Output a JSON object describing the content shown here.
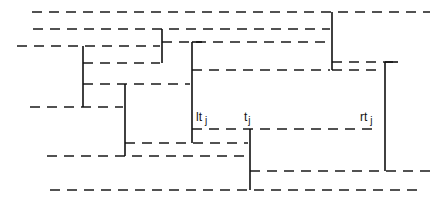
{
  "diagram": {
    "type": "timeline-interval-diagram",
    "labels": [
      {
        "id": "lt",
        "main": "lt",
        "sub": "j",
        "x": 196,
        "y": 121
      },
      {
        "id": "t",
        "main": "t",
        "sub": "j",
        "x": 244,
        "y": 121
      },
      {
        "id": "rt",
        "main": "rt",
        "sub": "j",
        "x": 360,
        "y": 121
      }
    ],
    "dashed_lines": [
      {
        "x1": 32,
        "y1": 12,
        "x2": 430,
        "y2": 12
      },
      {
        "x1": 33,
        "y1": 29,
        "x2": 330,
        "y2": 29
      },
      {
        "x1": 162,
        "y1": 42,
        "x2": 330,
        "y2": 42
      },
      {
        "x1": 17,
        "y1": 46,
        "x2": 160,
        "y2": 46
      },
      {
        "x1": 83,
        "y1": 63,
        "x2": 160,
        "y2": 63
      },
      {
        "x1": 332,
        "y1": 62,
        "x2": 400,
        "y2": 62
      },
      {
        "x1": 192,
        "y1": 70,
        "x2": 330,
        "y2": 70
      },
      {
        "x1": 332,
        "y1": 70,
        "x2": 380,
        "y2": 70
      },
      {
        "x1": 83,
        "y1": 84,
        "x2": 190,
        "y2": 84
      },
      {
        "x1": 30,
        "y1": 107,
        "x2": 123,
        "y2": 107
      },
      {
        "x1": 192,
        "y1": 129,
        "x2": 375,
        "y2": 129
      },
      {
        "x1": 125,
        "y1": 143,
        "x2": 248,
        "y2": 143
      },
      {
        "x1": 47,
        "y1": 156,
        "x2": 248,
        "y2": 156
      },
      {
        "x1": 250,
        "y1": 171,
        "x2": 432,
        "y2": 171
      },
      {
        "x1": 50,
        "y1": 190,
        "x2": 420,
        "y2": 190
      }
    ],
    "solid_lines": [
      {
        "x1": 83,
        "y1": 46,
        "x2": 83,
        "y2": 107
      },
      {
        "x1": 125,
        "y1": 84,
        "x2": 125,
        "y2": 156
      },
      {
        "x1": 162,
        "y1": 29,
        "x2": 162,
        "y2": 63
      },
      {
        "x1": 192,
        "y1": 42,
        "x2": 192,
        "y2": 143
      },
      {
        "x1": 250,
        "y1": 129,
        "x2": 250,
        "y2": 190
      },
      {
        "x1": 332,
        "y1": 12,
        "x2": 332,
        "y2": 70
      },
      {
        "x1": 385,
        "y1": 62,
        "x2": 385,
        "y2": 171
      },
      {
        "x1": 385,
        "y1": 62,
        "x2": 398,
        "y2": 62
      },
      {
        "x1": 192,
        "y1": 42,
        "x2": 202,
        "y2": 42
      }
    ],
    "colors": {
      "line": "#111111",
      "background": "#ffffff"
    }
  }
}
